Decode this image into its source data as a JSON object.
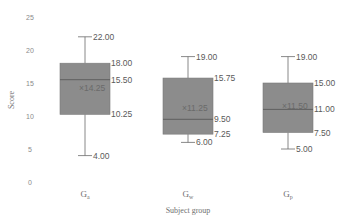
{
  "chart_data": {
    "type": "box",
    "title": "",
    "xlabel": "Subject group",
    "ylabel": "Score",
    "ylim": [
      0,
      25
    ],
    "yticks": [
      0,
      5,
      10,
      15,
      20,
      25
    ],
    "grid": false,
    "categories": [
      "Ga",
      "Gw",
      "Gp"
    ],
    "category_display": [
      {
        "main": "G",
        "sub": "a"
      },
      {
        "main": "G",
        "sub": "w"
      },
      {
        "main": "G",
        "sub": "p"
      }
    ],
    "series": [
      {
        "name": "Ga",
        "min": 4.0,
        "q1": 10.25,
        "median": 15.5,
        "q3": 18.0,
        "max": 22.0,
        "mean": 14.25,
        "labels": {
          "min": "4.00",
          "q1": "10.25",
          "median": "15.50",
          "q3": "18.00",
          "max": "22.00",
          "mean": "×14.25"
        }
      },
      {
        "name": "Gw",
        "min": 6.0,
        "q1": 7.25,
        "median": 9.5,
        "q3": 15.75,
        "max": 19.0,
        "mean": 11.25,
        "labels": {
          "min": "6.00",
          "q1": "7.25",
          "median": "9.50",
          "q3": "15.75",
          "max": "19.00",
          "mean": "×11.25"
        }
      },
      {
        "name": "Gp",
        "min": 5.0,
        "q1": 7.5,
        "median": 11.0,
        "q3": 15.0,
        "max": 19.0,
        "mean": 11.5,
        "labels": {
          "min": "5.00",
          "q1": "7.50",
          "median": "11.00",
          "q3": "15.00",
          "max": "19.00",
          "mean": "×11.50"
        }
      }
    ],
    "colors": {
      "box_fill": "#8c8c8c",
      "box_stroke": "#7a7a7a",
      "whisker": "#6a6a6a",
      "median": "#5a5a5a"
    }
  }
}
